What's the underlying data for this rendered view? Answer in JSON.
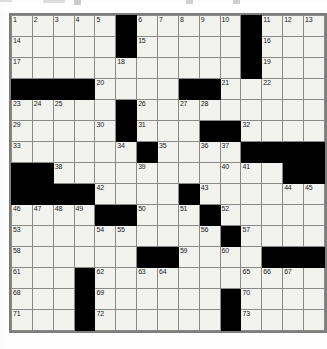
{
  "page": {
    "background_color": "#ffffff"
  },
  "top_strip": {
    "description": "clipped partial toolbar row above the puzzle",
    "visible": true
  },
  "crossword": {
    "name": "crossword-grid",
    "columns": 13,
    "rows": 15,
    "cell_size_px": 22,
    "colors": {
      "cell_fill": "#f2f2ef",
      "block_fill": "#000000",
      "grid_line": "#8a8a8a",
      "border": "#7d7d7d",
      "number_color": "#1a1a1a"
    },
    "highest_number": 73,
    "grid": [
      [
        {
          "type": "cell",
          "num": "1"
        },
        {
          "type": "cell",
          "num": "2"
        },
        {
          "type": "cell",
          "num": "3"
        },
        {
          "type": "cell",
          "num": "4"
        },
        {
          "type": "cell",
          "num": "5"
        },
        {
          "type": "block"
        },
        {
          "type": "cell",
          "num": "6"
        },
        {
          "type": "cell",
          "num": "7"
        },
        {
          "type": "cell",
          "num": "8"
        },
        {
          "type": "cell",
          "num": "9"
        },
        {
          "type": "cell",
          "num": "10"
        },
        {
          "type": "block"
        },
        {
          "type": "cell",
          "num": "11"
        },
        {
          "type": "cell",
          "num": "12"
        },
        {
          "type": "cell",
          "num": "13"
        }
      ],
      [
        {
          "type": "cell",
          "num": "14"
        },
        {
          "type": "cell",
          "num": ""
        },
        {
          "type": "cell",
          "num": ""
        },
        {
          "type": "cell",
          "num": ""
        },
        {
          "type": "cell",
          "num": ""
        },
        {
          "type": "block"
        },
        {
          "type": "cell",
          "num": "15"
        },
        {
          "type": "cell",
          "num": ""
        },
        {
          "type": "cell",
          "num": ""
        },
        {
          "type": "cell",
          "num": ""
        },
        {
          "type": "cell",
          "num": ""
        },
        {
          "type": "block"
        },
        {
          "type": "cell",
          "num": "16"
        },
        {
          "type": "cell",
          "num": ""
        },
        {
          "type": "cell",
          "num": ""
        }
      ],
      [
        {
          "type": "cell",
          "num": "17"
        },
        {
          "type": "cell",
          "num": ""
        },
        {
          "type": "cell",
          "num": ""
        },
        {
          "type": "cell",
          "num": ""
        },
        {
          "type": "cell",
          "num": ""
        },
        {
          "type": "cell",
          "num": "18"
        },
        {
          "type": "cell",
          "num": ""
        },
        {
          "type": "cell",
          "num": ""
        },
        {
          "type": "cell",
          "num": ""
        },
        {
          "type": "cell",
          "num": ""
        },
        {
          "type": "cell",
          "num": ""
        },
        {
          "type": "block"
        },
        {
          "type": "cell",
          "num": "19"
        },
        {
          "type": "cell",
          "num": ""
        },
        {
          "type": "cell",
          "num": ""
        }
      ],
      [
        {
          "type": "block"
        },
        {
          "type": "block"
        },
        {
          "type": "block"
        },
        {
          "type": "block"
        },
        {
          "type": "cell",
          "num": "20"
        },
        {
          "type": "cell",
          "num": ""
        },
        {
          "type": "cell",
          "num": ""
        },
        {
          "type": "cell",
          "num": ""
        },
        {
          "type": "block"
        },
        {
          "type": "block"
        },
        {
          "type": "cell",
          "num": "21"
        },
        {
          "type": "cell",
          "num": ""
        },
        {
          "type": "cell",
          "num": "22"
        },
        {
          "type": "cell",
          "num": ""
        },
        {
          "type": "cell",
          "num": ""
        }
      ],
      [
        {
          "type": "cell",
          "num": "23"
        },
        {
          "type": "cell",
          "num": "24"
        },
        {
          "type": "cell",
          "num": "25"
        },
        {
          "type": "cell",
          "num": ""
        },
        {
          "type": "cell",
          "num": ""
        },
        {
          "type": "block"
        },
        {
          "type": "cell",
          "num": "26"
        },
        {
          "type": "cell",
          "num": ""
        },
        {
          "type": "cell",
          "num": "27"
        },
        {
          "type": "cell",
          "num": "28"
        },
        {
          "type": "cell",
          "num": ""
        },
        {
          "type": "cell",
          "num": ""
        },
        {
          "type": "cell",
          "num": ""
        },
        {
          "type": "cell",
          "num": ""
        },
        {
          "type": "cell",
          "num": ""
        }
      ],
      [
        {
          "type": "cell",
          "num": "29"
        },
        {
          "type": "cell",
          "num": ""
        },
        {
          "type": "cell",
          "num": ""
        },
        {
          "type": "cell",
          "num": ""
        },
        {
          "type": "cell",
          "num": "30"
        },
        {
          "type": "block"
        },
        {
          "type": "cell",
          "num": "31"
        },
        {
          "type": "cell",
          "num": ""
        },
        {
          "type": "cell",
          "num": ""
        },
        {
          "type": "block"
        },
        {
          "type": "block"
        },
        {
          "type": "cell",
          "num": "32"
        },
        {
          "type": "cell",
          "num": ""
        },
        {
          "type": "cell",
          "num": ""
        },
        {
          "type": "cell",
          "num": ""
        }
      ],
      [
        {
          "type": "cell",
          "num": "33"
        },
        {
          "type": "cell",
          "num": ""
        },
        {
          "type": "cell",
          "num": ""
        },
        {
          "type": "cell",
          "num": ""
        },
        {
          "type": "cell",
          "num": ""
        },
        {
          "type": "cell",
          "num": "34"
        },
        {
          "type": "block"
        },
        {
          "type": "cell",
          "num": "35"
        },
        {
          "type": "cell",
          "num": ""
        },
        {
          "type": "cell",
          "num": "36"
        },
        {
          "type": "cell",
          "num": "37"
        },
        {
          "type": "block"
        },
        {
          "type": "block"
        },
        {
          "type": "block"
        },
        {
          "type": "block"
        }
      ],
      [
        {
          "type": "block"
        },
        {
          "type": "block"
        },
        {
          "type": "cell",
          "num": "38"
        },
        {
          "type": "cell",
          "num": ""
        },
        {
          "type": "cell",
          "num": ""
        },
        {
          "type": "cell",
          "num": ""
        },
        {
          "type": "cell",
          "num": "39"
        },
        {
          "type": "cell",
          "num": ""
        },
        {
          "type": "cell",
          "num": ""
        },
        {
          "type": "cell",
          "num": ""
        },
        {
          "type": "cell",
          "num": "40"
        },
        {
          "type": "cell",
          "num": "41"
        },
        {
          "type": "cell",
          "num": ""
        },
        {
          "type": "block"
        },
        {
          "type": "block"
        }
      ],
      [
        {
          "type": "block"
        },
        {
          "type": "block"
        },
        {
          "type": "block"
        },
        {
          "type": "block"
        },
        {
          "type": "cell",
          "num": "42"
        },
        {
          "type": "cell",
          "num": ""
        },
        {
          "type": "cell",
          "num": ""
        },
        {
          "type": "cell",
          "num": ""
        },
        {
          "type": "block"
        },
        {
          "type": "cell",
          "num": "43"
        },
        {
          "type": "cell",
          "num": ""
        },
        {
          "type": "cell",
          "num": ""
        },
        {
          "type": "cell",
          "num": ""
        },
        {
          "type": "cell",
          "num": "44"
        },
        {
          "type": "cell",
          "num": "45"
        }
      ],
      [
        {
          "type": "cell",
          "num": "46"
        },
        {
          "type": "cell",
          "num": "47"
        },
        {
          "type": "cell",
          "num": "48"
        },
        {
          "type": "cell",
          "num": "49"
        },
        {
          "type": "block"
        },
        {
          "type": "block"
        },
        {
          "type": "cell",
          "num": "50"
        },
        {
          "type": "cell",
          "num": ""
        },
        {
          "type": "cell",
          "num": "51"
        },
        {
          "type": "block"
        },
        {
          "type": "cell",
          "num": "52"
        },
        {
          "type": "cell",
          "num": ""
        },
        {
          "type": "cell",
          "num": ""
        },
        {
          "type": "cell",
          "num": ""
        },
        {
          "type": "cell",
          "num": ""
        }
      ],
      [
        {
          "type": "cell",
          "num": "53"
        },
        {
          "type": "cell",
          "num": ""
        },
        {
          "type": "cell",
          "num": ""
        },
        {
          "type": "cell",
          "num": ""
        },
        {
          "type": "cell",
          "num": "54"
        },
        {
          "type": "cell",
          "num": "55"
        },
        {
          "type": "cell",
          "num": ""
        },
        {
          "type": "cell",
          "num": ""
        },
        {
          "type": "cell",
          "num": ""
        },
        {
          "type": "cell",
          "num": "56"
        },
        {
          "type": "block"
        },
        {
          "type": "cell",
          "num": "57"
        },
        {
          "type": "cell",
          "num": ""
        },
        {
          "type": "cell",
          "num": ""
        },
        {
          "type": "cell",
          "num": ""
        }
      ],
      [
        {
          "type": "cell",
          "num": "58"
        },
        {
          "type": "cell",
          "num": ""
        },
        {
          "type": "cell",
          "num": ""
        },
        {
          "type": "cell",
          "num": ""
        },
        {
          "type": "cell",
          "num": ""
        },
        {
          "type": "cell",
          "num": ""
        },
        {
          "type": "block"
        },
        {
          "type": "block"
        },
        {
          "type": "cell",
          "num": "59"
        },
        {
          "type": "cell",
          "num": ""
        },
        {
          "type": "cell",
          "num": "60"
        },
        {
          "type": "cell",
          "num": ""
        },
        {
          "type": "block"
        },
        {
          "type": "block"
        },
        {
          "type": "block"
        }
      ],
      [
        {
          "type": "cell",
          "num": "61"
        },
        {
          "type": "cell",
          "num": ""
        },
        {
          "type": "cell",
          "num": ""
        },
        {
          "type": "block"
        },
        {
          "type": "cell",
          "num": "62"
        },
        {
          "type": "cell",
          "num": ""
        },
        {
          "type": "cell",
          "num": "63"
        },
        {
          "type": "cell",
          "num": "64"
        },
        {
          "type": "cell",
          "num": ""
        },
        {
          "type": "cell",
          "num": ""
        },
        {
          "type": "cell",
          "num": ""
        },
        {
          "type": "cell",
          "num": "65"
        },
        {
          "type": "cell",
          "num": "66"
        },
        {
          "type": "cell",
          "num": "67"
        },
        {
          "type": "cell",
          "num": ""
        }
      ],
      [
        {
          "type": "cell",
          "num": "68"
        },
        {
          "type": "cell",
          "num": ""
        },
        {
          "type": "cell",
          "num": ""
        },
        {
          "type": "block"
        },
        {
          "type": "cell",
          "num": "69"
        },
        {
          "type": "cell",
          "num": ""
        },
        {
          "type": "cell",
          "num": ""
        },
        {
          "type": "cell",
          "num": ""
        },
        {
          "type": "cell",
          "num": ""
        },
        {
          "type": "cell",
          "num": ""
        },
        {
          "type": "block"
        },
        {
          "type": "cell",
          "num": "70"
        },
        {
          "type": "cell",
          "num": ""
        },
        {
          "type": "cell",
          "num": ""
        },
        {
          "type": "cell",
          "num": ""
        }
      ],
      [
        {
          "type": "cell",
          "num": "71"
        },
        {
          "type": "cell",
          "num": ""
        },
        {
          "type": "cell",
          "num": ""
        },
        {
          "type": "block"
        },
        {
          "type": "cell",
          "num": "72"
        },
        {
          "type": "cell",
          "num": ""
        },
        {
          "type": "cell",
          "num": ""
        },
        {
          "type": "cell",
          "num": ""
        },
        {
          "type": "cell",
          "num": ""
        },
        {
          "type": "cell",
          "num": ""
        },
        {
          "type": "block"
        },
        {
          "type": "cell",
          "num": "73"
        },
        {
          "type": "cell",
          "num": ""
        },
        {
          "type": "cell",
          "num": ""
        },
        {
          "type": "cell",
          "num": ""
        }
      ]
    ]
  }
}
